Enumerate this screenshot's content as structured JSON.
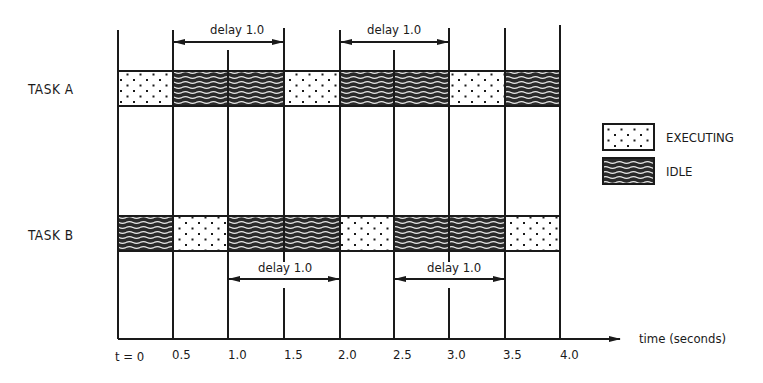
{
  "tasks": [
    {
      "label": "TASK A",
      "segments": [
        "executing",
        "idle",
        "idle",
        "executing",
        "idle",
        "idle",
        "executing",
        "idle"
      ]
    },
    {
      "label": "TASK B",
      "segments": [
        "idle",
        "executing",
        "idle",
        "idle",
        "executing",
        "idle",
        "idle",
        "executing"
      ]
    }
  ],
  "delays": [
    {
      "task": "A",
      "label": "delay 1.0",
      "from": 0.5,
      "to": 1.5
    },
    {
      "task": "A",
      "label": "delay 1.0",
      "from": 2.0,
      "to": 3.0
    },
    {
      "task": "B",
      "label": "delay 1.0",
      "from": 1.0,
      "to": 2.0
    },
    {
      "task": "B",
      "label": "delay 1.0",
      "from": 2.5,
      "to": 3.5
    }
  ],
  "axis": {
    "label": "time (seconds)",
    "ticks": [
      "t = 0",
      "0.5",
      "1.0",
      "1.5",
      "2.0",
      "2.5",
      "3.0",
      "3.5",
      "4.0"
    ]
  },
  "legend": {
    "executing": "EXECUTING",
    "idle": "IDLE"
  },
  "colors": {
    "ink": "#1a1a1a",
    "background": "#ffffff"
  }
}
